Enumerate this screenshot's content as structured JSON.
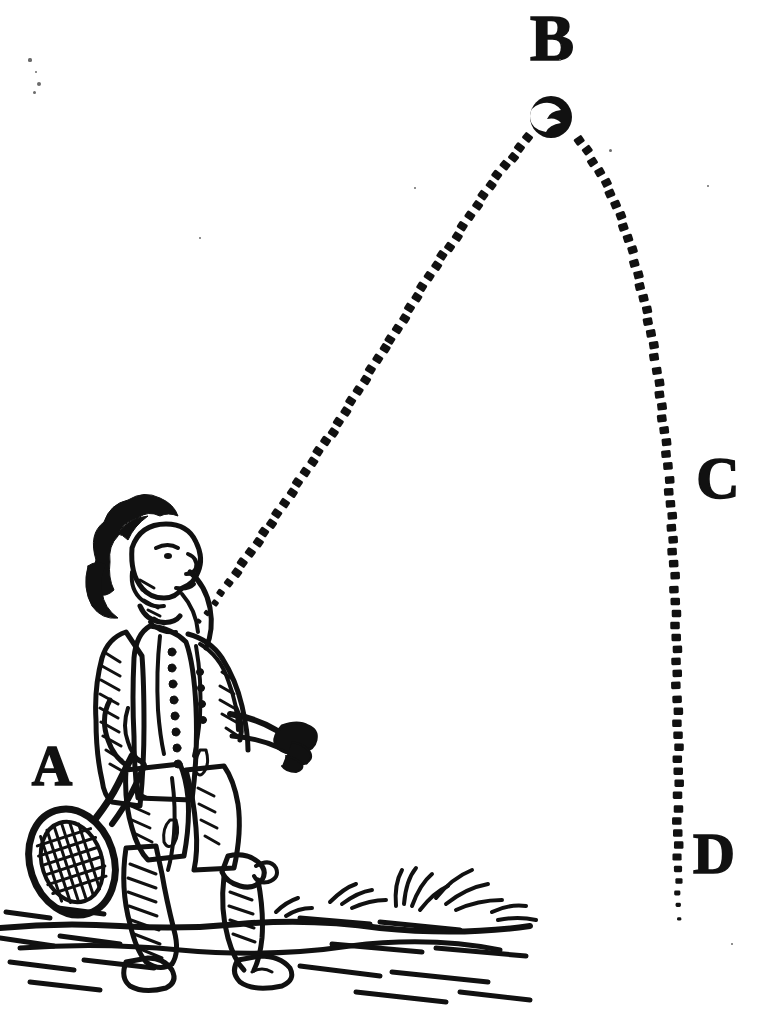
{
  "figure": {
    "kind": "woodcut-diagram",
    "background_color": "#ffffff",
    "ink_color": "#111111",
    "width": 768,
    "height": 1028
  },
  "labels": [
    {
      "id": "A",
      "text": "A",
      "meaning": "point-of-strike-at-racket",
      "x": 52,
      "y": 782
    },
    {
      "id": "B",
      "text": "B",
      "meaning": "apex-of-trajectory",
      "x": 552,
      "y": 56
    },
    {
      "id": "C",
      "text": "C",
      "meaning": "descent-midpoint",
      "x": 718,
      "y": 495
    },
    {
      "id": "D",
      "text": "D",
      "meaning": "landing-end-of-path",
      "x": 714,
      "y": 870
    }
  ],
  "ball": {
    "name": "tennis-ball",
    "cx": 551,
    "cy": 117,
    "r": 21,
    "highlight": "white-crescent"
  },
  "trajectory": {
    "style": "dotted-dashes",
    "dash_count": 118,
    "from_label": "A",
    "to_label": "D",
    "apex_label": "B",
    "start": {
      "x": 200,
      "y": 622
    },
    "apex": {
      "x": 551,
      "y": 117
    },
    "end": {
      "x": 678,
      "y": 918
    },
    "ascending_points": [
      [
        200,
        622
      ],
      [
        232,
        578
      ],
      [
        262,
        536
      ],
      [
        290,
        495
      ],
      [
        316,
        456
      ],
      [
        341,
        418
      ],
      [
        365,
        380
      ],
      [
        388,
        343
      ],
      [
        411,
        306
      ],
      [
        433,
        271
      ],
      [
        455,
        238
      ],
      [
        476,
        206
      ],
      [
        497,
        177
      ],
      [
        518,
        150
      ],
      [
        536,
        130
      ]
    ],
    "descending_points": [
      [
        566,
        128
      ],
      [
        586,
        150
      ],
      [
        603,
        177
      ],
      [
        617,
        208
      ],
      [
        629,
        243
      ],
      [
        640,
        282
      ],
      [
        649,
        323
      ],
      [
        656,
        366
      ],
      [
        662,
        410
      ],
      [
        667,
        455
      ],
      [
        670,
        500
      ],
      [
        673,
        546
      ],
      [
        675,
        592
      ],
      [
        676,
        638
      ],
      [
        677,
        684
      ],
      [
        678,
        730
      ],
      [
        678,
        776
      ],
      [
        678,
        822
      ],
      [
        678,
        868
      ],
      [
        678,
        918
      ]
    ]
  },
  "player": {
    "name": "tennis-player",
    "pose": "standing, looking upward, right arm outstretched",
    "holding": "tennis-racket",
    "era_costume": "17th-century coat, breeches, stockings, buckled shoes",
    "bounding_box": {
      "x": 20,
      "y": 512,
      "w": 310,
      "h": 480
    }
  },
  "ground": {
    "name": "ground-with-grass",
    "features": [
      "grass-tufts",
      "horizontal-hatching",
      "ground-line"
    ],
    "bounding_box": {
      "x": 0,
      "y": 880,
      "w": 540,
      "h": 130
    }
  },
  "specks": [
    {
      "x": 30,
      "y": 60,
      "r": 1.6
    },
    {
      "x": 36,
      "y": 72,
      "r": 1.4
    },
    {
      "x": 39,
      "y": 84,
      "r": 2.0
    },
    {
      "x": 34,
      "y": 92,
      "r": 1.5
    },
    {
      "x": 560,
      "y": 60,
      "r": 1.3
    },
    {
      "x": 610,
      "y": 150,
      "r": 1.5
    },
    {
      "x": 415,
      "y": 188,
      "r": 1.4
    },
    {
      "x": 708,
      "y": 186,
      "r": 1.3
    },
    {
      "x": 732,
      "y": 944,
      "r": 1.4
    },
    {
      "x": 200,
      "y": 238,
      "r": 1.2
    }
  ]
}
